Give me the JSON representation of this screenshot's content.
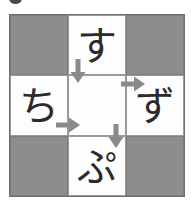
{
  "puzzle": {
    "title": "kana-crossword-grid",
    "rows": 3,
    "cols": 3,
    "colors": {
      "blocked_cell": "#8d8d8d",
      "open_cell": "#fdfdfd",
      "grid_line": "#9a9a9a",
      "grid_border": "#6e6e6e",
      "kana_text": "#2b2b2b",
      "arrow": "#8a8a8a",
      "top_mark": "#4a4a4a"
    },
    "cells": [
      {
        "id": "r1c1",
        "state": "blocked",
        "kana": ""
      },
      {
        "id": "r1c2",
        "state": "open",
        "kana": "す"
      },
      {
        "id": "r1c3",
        "state": "blocked",
        "kana": ""
      },
      {
        "id": "r2c1",
        "state": "open",
        "kana": "ち"
      },
      {
        "id": "r2c2",
        "state": "open",
        "kana": ""
      },
      {
        "id": "r2c3",
        "state": "open",
        "kana": "ず"
      },
      {
        "id": "r3c1",
        "state": "blocked",
        "kana": ""
      },
      {
        "id": "r3c2",
        "state": "open",
        "kana": "ぷ"
      },
      {
        "id": "r3c3",
        "state": "blocked",
        "kana": ""
      }
    ],
    "arrows": [
      {
        "id": "arrow-down-into-center",
        "direction": "down"
      },
      {
        "id": "arrow-right-into-center",
        "direction": "right"
      },
      {
        "id": "arrow-right-into-zu",
        "direction": "right"
      },
      {
        "id": "arrow-down-into-pu",
        "direction": "down"
      }
    ]
  }
}
